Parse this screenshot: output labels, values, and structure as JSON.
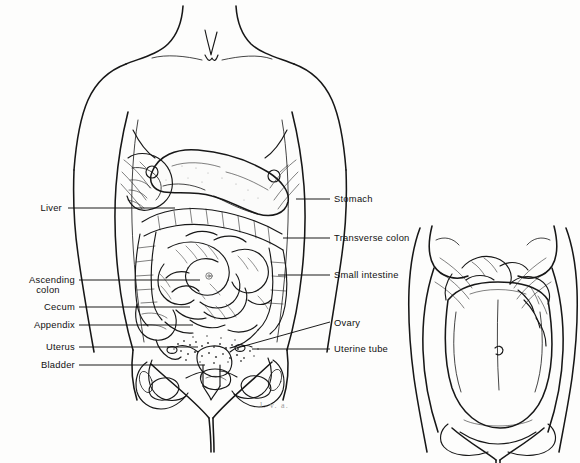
{
  "figure": {
    "background_color": "#fdfdfc",
    "ink_color": "#171717",
    "signature": "l. v. a."
  },
  "labels_left": [
    {
      "id": "liver",
      "text": "Liver",
      "text2": "",
      "x": 62,
      "y": 211,
      "leader": [
        [
          68,
          208
        ],
        [
          175,
          208
        ]
      ]
    },
    {
      "id": "ascending-colon",
      "text": "Ascending",
      "text2": "colon",
      "x": 75,
      "y": 283,
      "leader": [
        [
          79,
          280
        ],
        [
          200,
          280
        ]
      ]
    },
    {
      "id": "cecum",
      "text": "Cecum",
      "text2": "",
      "x": 75,
      "y": 310,
      "leader": [
        [
          79,
          307
        ],
        [
          190,
          307
        ]
      ]
    },
    {
      "id": "appendix",
      "text": "Appendix",
      "text2": "",
      "x": 75,
      "y": 328,
      "leader": [
        [
          79,
          325
        ],
        [
          193,
          325
        ]
      ]
    },
    {
      "id": "uterus",
      "text": "Uterus",
      "text2": "",
      "x": 75,
      "y": 350,
      "leader": [
        [
          79,
          347
        ],
        [
          198,
          347
        ]
      ]
    },
    {
      "id": "bladder",
      "text": "Bladder",
      "text2": "",
      "x": 75,
      "y": 368,
      "leader": [
        [
          79,
          365
        ],
        [
          205,
          365
        ]
      ]
    }
  ],
  "labels_right": [
    {
      "id": "stomach",
      "text": "Stomach",
      "x": 334,
      "y": 202,
      "leader": [
        [
          296,
          199
        ],
        [
          330,
          199
        ]
      ]
    },
    {
      "id": "transverse-colon",
      "text": "Transverse colon",
      "x": 334,
      "y": 241,
      "leader": [
        [
          283,
          238
        ],
        [
          330,
          238
        ]
      ]
    },
    {
      "id": "small-intestine",
      "text": "Small intestine",
      "x": 334,
      "y": 278,
      "leader": [
        [
          278,
          275
        ],
        [
          330,
          275
        ]
      ]
    },
    {
      "id": "ovary",
      "text": "Ovary",
      "x": 334,
      "y": 326,
      "leader": [
        [
          237,
          348
        ],
        [
          330,
          322
        ]
      ]
    },
    {
      "id": "uterine-tube",
      "text": "Uterine tube",
      "x": 334,
      "y": 352,
      "leader": [
        [
          252,
          349
        ],
        [
          330,
          349
        ]
      ]
    }
  ]
}
